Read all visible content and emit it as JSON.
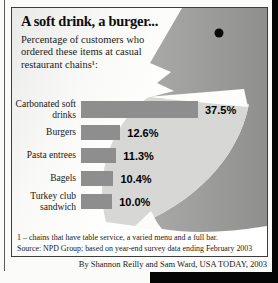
{
  "page": {
    "byline": "By Shannon Reilly and Sam Ward, USA TODAY, 2003"
  },
  "infographic": {
    "title": "A soft drink, a burger...",
    "subtitle": "Percentage of customers who ordered these items at casual restaurant chains¹:",
    "footnote": "1 – chains that have table service, a varied menu and a full bar.",
    "source": "Source: NPD Group; based on year-end survey data ending February 2003"
  },
  "illustration": {
    "name": "bird-silhouette",
    "colors": {
      "body_light": "#acacaa",
      "body_dark": "#8f8f8d",
      "breast": "#d7d7d5",
      "mouth": "#fdfdfc",
      "eye": "#0b0b0b"
    }
  },
  "chart_data": {
    "type": "bar",
    "orientation": "horizontal",
    "title": "A soft drink, a burger...",
    "subtitle": "Percentage of customers who ordered these items at casual restaurant chains¹:",
    "categories": [
      "Carbonated soft drinks",
      "Burgers",
      "Pasta entrees",
      "Bagels",
      "Turkey club sandwich"
    ],
    "values": [
      37.5,
      12.6,
      11.3,
      10.4,
      10.0
    ],
    "value_labels": [
      "37.5%",
      "12.6%",
      "11.3%",
      "10.4%",
      "10.0%"
    ],
    "xlim": [
      0,
      40
    ],
    "bar_color": "#8e8e8e",
    "grid": false,
    "legend": false
  }
}
